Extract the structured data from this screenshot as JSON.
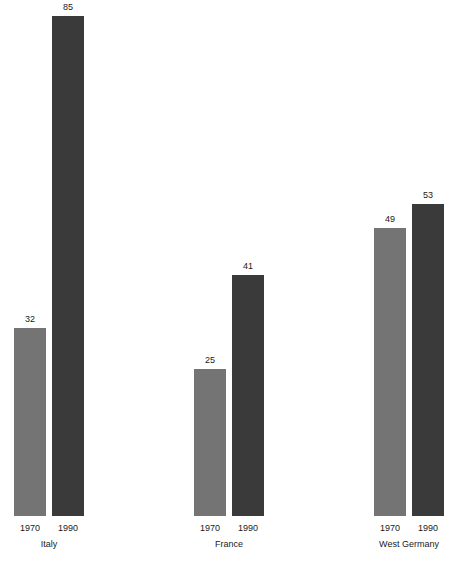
{
  "chart_data": {
    "type": "bar",
    "title": "",
    "subtitle": "",
    "xlabel": "",
    "ylabel": "",
    "grid": false,
    "legend": "none",
    "axis_visible": false,
    "ylim": [
      0,
      85
    ],
    "categories": [
      "Italy",
      "France",
      "West Germany"
    ],
    "tick_labels": [
      "1970",
      "1990"
    ],
    "series": [
      {
        "name": "1970",
        "color": "#747474",
        "values": [
          32,
          25,
          49
        ]
      },
      {
        "name": "1990",
        "color": "#3a3a3a",
        "values": [
          85,
          41,
          53
        ]
      }
    ],
    "data_labels": [
      "32",
      "85",
      "25",
      "41",
      "49",
      "53"
    ]
  },
  "groups": [
    {
      "label": "Italy",
      "bars": [
        {
          "tick": "1970",
          "value": 32,
          "value_label": "32",
          "color": "#747474"
        },
        {
          "tick": "1990",
          "value": 85,
          "value_label": "85",
          "color": "#3a3a3a"
        }
      ]
    },
    {
      "label": "France",
      "bars": [
        {
          "tick": "1970",
          "value": 25,
          "value_label": "25",
          "color": "#747474"
        },
        {
          "tick": "1990",
          "value": 41,
          "value_label": "41",
          "color": "#3a3a3a"
        }
      ]
    },
    {
      "label": "West Germany",
      "bars": [
        {
          "tick": "1970",
          "value": 49,
          "value_label": "49",
          "color": "#747474"
        },
        {
          "tick": "1990",
          "value": 53,
          "value_label": "53",
          "color": "#3a3a3a"
        }
      ]
    }
  ],
  "layout": {
    "group_left": [
      8,
      188,
      368
    ],
    "group_width": 82,
    "bar_width": 32,
    "bar_slot_left": [
      6,
      44
    ],
    "px_per_unit": 5.88,
    "background": "#ffffff"
  }
}
